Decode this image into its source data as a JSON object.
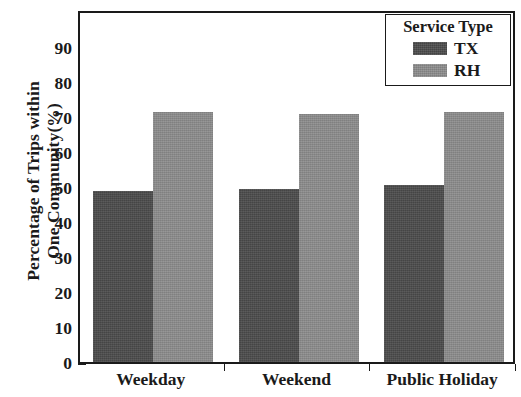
{
  "chart_data": {
    "type": "bar",
    "title": "",
    "subtitle": "",
    "xlabel": "",
    "ylabel": "Percentage of Trips within One Community(%)",
    "ylabel_line1": "Percentage of Trips within",
    "ylabel_line2": "One Community(%)",
    "categories": [
      "Weekday",
      "Weekend",
      "Public Holiday"
    ],
    "series": [
      {
        "name": "TX",
        "color": "#4c4c4c",
        "values": [
          48.8,
          49.5,
          50.6
        ]
      },
      {
        "name": "RH",
        "color": "#8d8d8d",
        "values": [
          71.5,
          70.9,
          71.5
        ]
      }
    ],
    "ylim": [
      0,
      101
    ],
    "y_ticks": [
      0,
      10,
      20,
      30,
      40,
      50,
      60,
      70,
      80,
      90
    ],
    "y_tick_labels": [
      "0",
      "10",
      "20",
      "30",
      "40",
      "50",
      "60",
      "70",
      "80",
      "90"
    ],
    "grid": false,
    "legend": {
      "title": "Service Type",
      "position": "top-right",
      "entries": [
        {
          "label": "TX",
          "color": "#4c4c4c"
        },
        {
          "label": "RH",
          "color": "#8d8d8d"
        }
      ]
    }
  },
  "colors": {
    "axis": "#1a1a1a",
    "background": "#ffffff",
    "tx": "#4c4c4c",
    "rh": "#8d8d8d"
  }
}
